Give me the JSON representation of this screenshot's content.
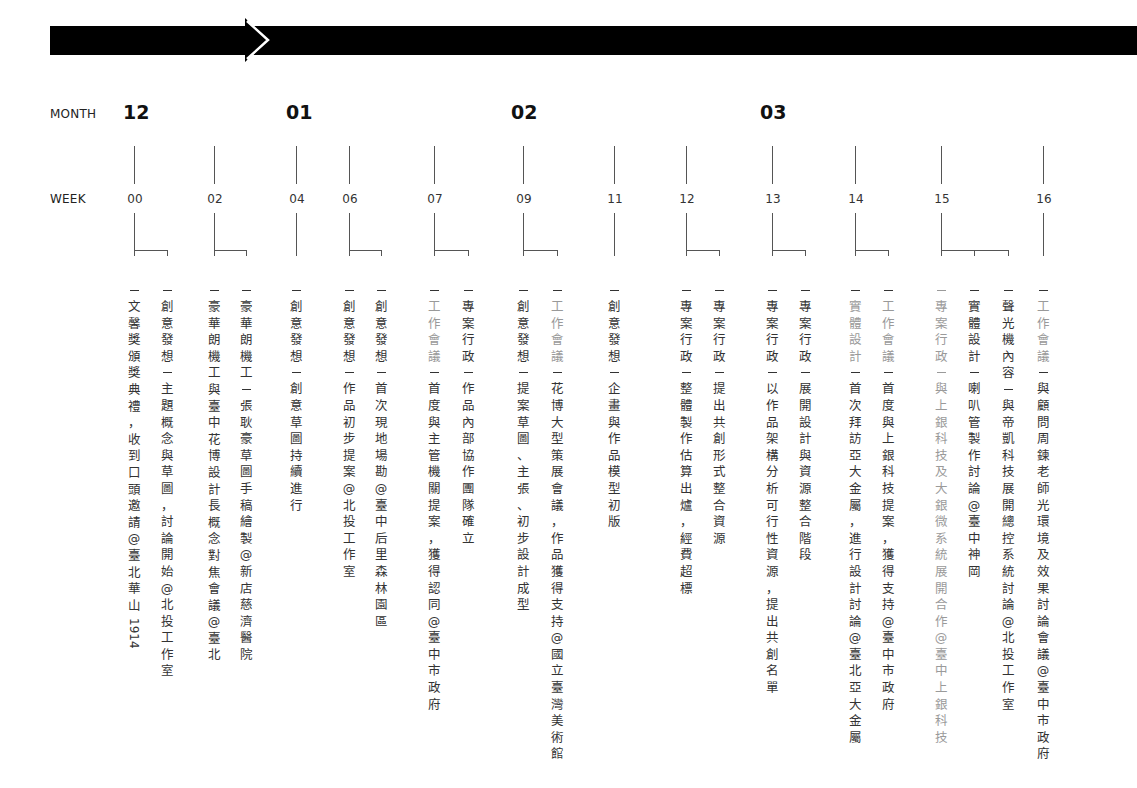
{
  "header": {
    "row_month_label": "MONTH",
    "row_week_label": "WEEK"
  },
  "months": [
    {
      "label": "12",
      "x": 123
    },
    {
      "label": "01",
      "x": 286
    },
    {
      "label": "02",
      "x": 511
    },
    {
      "label": "03",
      "x": 760
    }
  ],
  "weeks": [
    {
      "label": "00",
      "x": 134,
      "bracket_to": [
        167
      ]
    },
    {
      "label": "02",
      "x": 214,
      "bracket_to": [
        246
      ]
    },
    {
      "label": "04",
      "x": 296,
      "bracket_to": []
    },
    {
      "label": "06",
      "x": 349,
      "bracket_to": [
        381
      ]
    },
    {
      "label": "07",
      "x": 434,
      "bracket_to": [
        468
      ]
    },
    {
      "label": "09",
      "x": 523,
      "bracket_to": [
        557
      ]
    },
    {
      "label": "11",
      "x": 614,
      "bracket_to": []
    },
    {
      "label": "12",
      "x": 686,
      "bracket_to": [
        719
      ]
    },
    {
      "label": "13",
      "x": 772,
      "bracket_to": [
        805
      ]
    },
    {
      "label": "14",
      "x": 855,
      "bracket_to": [
        888
      ]
    },
    {
      "label": "15",
      "x": 941,
      "bracket_to": [
        974,
        1008
      ]
    },
    {
      "label": "16",
      "x": 1043,
      "bracket_to": []
    }
  ],
  "events": [
    {
      "week": "00",
      "x": 134,
      "category": "",
      "text": "文馨獎頒獎典禮，收到口頭邀請@臺北華山",
      "latin_suffix": "1914",
      "style": "normal"
    },
    {
      "week": "00",
      "x": 167,
      "category": "創意發想",
      "text": "主題概念與草圖，討論開始@北投工作室",
      "style": "normal"
    },
    {
      "week": "02",
      "x": 214,
      "category": "",
      "text": "豪華朗機工與臺中花博設計長概念對焦會議@臺北",
      "style": "normal"
    },
    {
      "week": "02",
      "x": 246,
      "category": "豪華朗機工",
      "text": "張耿豪草圖手稿繪製@新店慈濟醫院",
      "style": "normal"
    },
    {
      "week": "04",
      "x": 296,
      "category": "創意發想",
      "text": "創意草圖持續進行",
      "style": "normal"
    },
    {
      "week": "06",
      "x": 349,
      "category": "創意發想",
      "text": "作品初步提案@北投工作室",
      "style": "normal"
    },
    {
      "week": "06",
      "x": 381,
      "category": "創意發想",
      "text": "首次現地場勘@臺中后里森林園區",
      "style": "normal"
    },
    {
      "week": "07",
      "x": 434,
      "category": "工作會議",
      "text": "首度與主管機關提案，獲得認同@臺中市政府",
      "style": "grey-cat"
    },
    {
      "week": "07",
      "x": 468,
      "category": "專案行政",
      "text": "作品內部協作團隊確立",
      "style": "normal"
    },
    {
      "week": "09",
      "x": 523,
      "category": "創意發想",
      "text": "提案草圖、主張、初步設計成型",
      "style": "normal"
    },
    {
      "week": "09",
      "x": 557,
      "category": "工作會議",
      "text": "花博大型策展會議，作品獲得支持@國立臺灣美術館",
      "style": "grey-cat"
    },
    {
      "week": "11",
      "x": 614,
      "category": "創意發想",
      "text": "企畫與作品模型初版",
      "style": "normal"
    },
    {
      "week": "12",
      "x": 686,
      "category": "專案行政",
      "text": "整體製作估算出爐，經費超標",
      "style": "normal"
    },
    {
      "week": "12",
      "x": 719,
      "category": "專案行政",
      "text": "提出共創形式整合資源",
      "style": "normal"
    },
    {
      "week": "13",
      "x": 772,
      "category": "專案行政",
      "text": "以作品架構分析可行性資源，提出共創名單",
      "style": "normal"
    },
    {
      "week": "13",
      "x": 805,
      "category": "專案行政",
      "text": "展開設計與資源整合階段",
      "style": "normal"
    },
    {
      "week": "14",
      "x": 855,
      "category": "實體設計",
      "text": "首次拜訪亞大金屬，進行設計討論@臺北亞大金屬",
      "style": "grey-cat"
    },
    {
      "week": "14",
      "x": 888,
      "category": "工作會議",
      "text": "首度與上銀科技提案，獲得支持@臺中市政府",
      "style": "grey-cat"
    },
    {
      "week": "15",
      "x": 941,
      "category": "專案行政",
      "text": "與上銀科技及大銀微系統展開合作@臺中上銀科技",
      "style": "all-grey"
    },
    {
      "week": "15",
      "x": 974,
      "category": "實體設計",
      "text": "喇叭管製作討論@臺中神岡",
      "style": "normal"
    },
    {
      "week": "15",
      "x": 1008,
      "category": "聲光機內容",
      "text": "與帝凱科技展開總控系統討論@北投工作室",
      "style": "normal"
    },
    {
      "week": "16",
      "x": 1043,
      "category": "工作會議",
      "text": "與顧問周鍊老師光環境及效果討論會議@臺中市政府",
      "style": "grey-cat"
    }
  ],
  "colors": {
    "arrow": "#000000",
    "text": "#333333",
    "category_grey": "#999999",
    "line": "#555555"
  }
}
